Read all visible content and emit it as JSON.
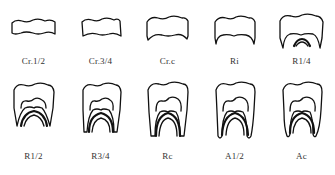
{
  "figure": {
    "stages": [
      {
        "id": "cr12",
        "label": "Cr.1/2"
      },
      {
        "id": "cr34",
        "label": "Cr.3/4"
      },
      {
        "id": "crc",
        "label": "Cr.c"
      },
      {
        "id": "ri",
        "label": "Ri"
      },
      {
        "id": "r14",
        "label": "R1/4"
      },
      {
        "id": "r12",
        "label": "R1/2"
      },
      {
        "id": "r34",
        "label": "R3/4"
      },
      {
        "id": "rc",
        "label": "Rc"
      },
      {
        "id": "a12",
        "label": "A1/2"
      },
      {
        "id": "ac",
        "label": "Ac"
      }
    ]
  }
}
